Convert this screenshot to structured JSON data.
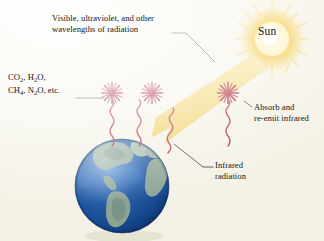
{
  "figure": {
    "name": "greenhouse-effect-diagram",
    "background_color": "#f4f2e6"
  },
  "labels": {
    "incoming_radiation_line1": "Visible, ultraviolet, and other",
    "incoming_radiation_line2": "wavelengths of radiation",
    "greenhouse_gases_line1_a": "CO",
    "greenhouse_gases_line1_a_sub": "2",
    "greenhouse_gases_line1_b": ", H",
    "greenhouse_gases_line1_b_sub": "2",
    "greenhouse_gases_line1_c": "O,",
    "greenhouse_gases_line2_a": "CH",
    "greenhouse_gases_line2_a_sub": "4",
    "greenhouse_gases_line2_b": ", N",
    "greenhouse_gases_line2_b_sub": "2",
    "greenhouse_gases_line2_c": "O, etc.",
    "absorb_line1": "Absorb and",
    "absorb_line2": "re-emit infrared",
    "infrared_line1": "Infrared",
    "infrared_line2": "radiation",
    "sun": "Sun"
  },
  "colors": {
    "sun_core": "#ffffff",
    "sun_inner": "#f7d24a",
    "sun_outer": "#f2c94c",
    "sun_halo": "#fbeab0",
    "beam": "#f2d873",
    "beam_edge": "#e8c75a",
    "molecule": "#9e1f3c",
    "molecule_core": "#c0283f",
    "infrared_wave": "#b0304c",
    "earth_ocean": "#1b4f9c",
    "earth_ocean_light": "#3f7fd0",
    "earth_land": "#8fa898",
    "earth_land_dark": "#5d7a6b",
    "leader_line": "#3a3a3a",
    "text": "#161616"
  },
  "elements": {
    "sun_name": "sun",
    "earth_name": "earth",
    "beam_name": "solar-radiation-beam",
    "molecule_count": 3,
    "infrared_wave_count": 4
  }
}
